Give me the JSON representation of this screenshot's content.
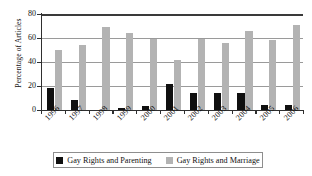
{
  "chart_data": {
    "type": "bar",
    "title": "",
    "xlabel": "",
    "ylabel": "Percentage of Articles",
    "ylim": [
      0,
      80
    ],
    "yticks": [
      0,
      20,
      40,
      60,
      80
    ],
    "grid": true,
    "legend_position": "bottom",
    "categories": [
      "1996",
      "1997",
      "1998",
      "1999",
      "2000",
      "2001",
      "2002",
      "2003",
      "2004",
      "2005",
      "2006"
    ],
    "series": [
      {
        "name": "Gay Rights and Parenting",
        "color": "#101010",
        "values": [
          18,
          8,
          0,
          1.5,
          3,
          21.5,
          14.5,
          14.5,
          14,
          4.5,
          4.5
        ]
      },
      {
        "name": "Gay Rights and Marriage",
        "color": "#b3b3b3",
        "values": [
          50,
          54.5,
          69.5,
          64,
          59.5,
          41.5,
          59,
          55.5,
          66,
          58,
          71
        ]
      }
    ]
  },
  "axis": {
    "y_title": "Percentage of Articles",
    "y_tick_labels": [
      "0",
      "20",
      "40",
      "60",
      "80"
    ],
    "x_tick_labels": [
      "1996",
      "1997",
      "1998",
      "1999",
      "2000",
      "2001",
      "2002",
      "2003",
      "2004",
      "2005",
      "2006"
    ]
  },
  "legend": {
    "entries": [
      {
        "label": "Gay Rights and Parenting",
        "color": "#101010"
      },
      {
        "label": "Gay Rights and Marriage",
        "color": "#b3b3b3"
      }
    ]
  },
  "colors": {
    "series_parenting": "#101010",
    "series_marriage": "#b3b3b3",
    "axis": "#2f2f2f",
    "gridline": "#9a9a9a",
    "background": "#ffffff"
  }
}
